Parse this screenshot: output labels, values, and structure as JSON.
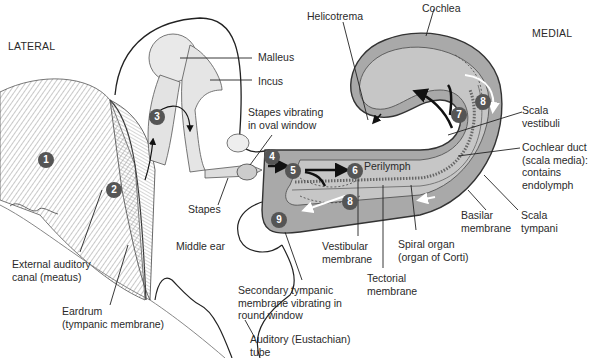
{
  "orientation": {
    "lateral": "LATERAL",
    "medial": "MEDIAL"
  },
  "colors": {
    "cochlea_fill": "#a9a9a9",
    "cochlea_inner": "#c6c6c6",
    "duct_fill": "#bdbdbd",
    "marker_fill": "#555555",
    "marker_text": "#ffffff",
    "line": "#2a2a2a"
  },
  "labels": {
    "malleus": "Malleus",
    "incus": "Incus",
    "stapes_vibrating": "Stapes vibrating\nin oval window",
    "stapes": "Stapes",
    "middle_ear": "Middle ear",
    "external_canal": "External auditory\ncanal (meatus)",
    "eardrum": "Eardrum\n(tympanic membrane)",
    "secondary_tympanic": "Secondary tympanic\nmembrane vibrating in\nround window",
    "auditory_tube": "Auditory (Eustachian)\ntube",
    "vestibular_membrane": "Vestibular\nmembrane",
    "tectorial_membrane": "Tectorial\nmembrane",
    "spiral_organ": "Spiral organ\n(organ of Corti)",
    "basilar_membrane": "Basilar\nmembrane",
    "scala_tympani": "Scala\ntympani",
    "cochlear_duct": "Cochlear duct\n(scala media):\ncontains\nendolymph",
    "scala_vestibuli": "Scala\nvestibuli",
    "cochlea": "Cochlea",
    "helicotrema": "Helicotrema",
    "perilymph": "Perilymph"
  },
  "markers": [
    {
      "n": "1",
      "x": 46,
      "y": 160
    },
    {
      "n": "2",
      "x": 114,
      "y": 190
    },
    {
      "n": "3",
      "x": 157,
      "y": 117
    },
    {
      "n": "4",
      "x": 272,
      "y": 157
    },
    {
      "n": "5",
      "x": 293,
      "y": 171
    },
    {
      "n": "6",
      "x": 355,
      "y": 171
    },
    {
      "n": "7",
      "x": 459,
      "y": 115
    },
    {
      "n": "8",
      "x": 483,
      "y": 102
    },
    {
      "n": "8",
      "x": 350,
      "y": 202
    },
    {
      "n": "9",
      "x": 279,
      "y": 220
    }
  ]
}
